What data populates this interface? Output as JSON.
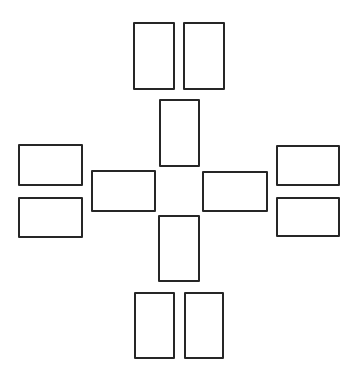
{
  "diagram": {
    "type": "card-spread-layout",
    "stroke_color": "#262626",
    "background": "#ffffff",
    "cards": [
      {
        "id": "top-left",
        "x": 133,
        "y": 22,
        "w": 42,
        "h": 68
      },
      {
        "id": "top-right",
        "x": 183,
        "y": 22,
        "w": 42,
        "h": 68
      },
      {
        "id": "center-top",
        "x": 159,
        "y": 99,
        "w": 41,
        "h": 68
      },
      {
        "id": "left-upper",
        "x": 18,
        "y": 144,
        "w": 65,
        "h": 42
      },
      {
        "id": "left-lower",
        "x": 18,
        "y": 197,
        "w": 65,
        "h": 41
      },
      {
        "id": "center-left",
        "x": 91,
        "y": 170,
        "w": 65,
        "h": 42
      },
      {
        "id": "center-right",
        "x": 202,
        "y": 171,
        "w": 66,
        "h": 41
      },
      {
        "id": "right-upper",
        "x": 276,
        "y": 145,
        "w": 64,
        "h": 41
      },
      {
        "id": "right-lower",
        "x": 276,
        "y": 197,
        "w": 64,
        "h": 40
      },
      {
        "id": "center-bottom",
        "x": 158,
        "y": 215,
        "w": 42,
        "h": 67
      },
      {
        "id": "bottom-left",
        "x": 134,
        "y": 292,
        "w": 41,
        "h": 67
      },
      {
        "id": "bottom-right",
        "x": 184,
        "y": 292,
        "w": 40,
        "h": 67
      }
    ]
  }
}
